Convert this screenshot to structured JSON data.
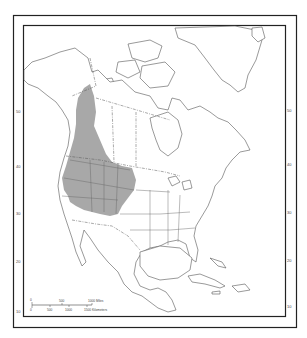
{
  "map": {
    "region": "North America",
    "range_fill_color": "#a8a8a8",
    "frame_color": "#222222",
    "range_description": "Shaded distribution in western North America",
    "latitude_labels_left": [
      "50",
      "40",
      "30",
      "20",
      "10"
    ],
    "latitude_labels_right": [
      "50",
      "40",
      "30",
      "20",
      "10"
    ],
    "scale_bar": {
      "miles_labels": [
        "0",
        "500",
        "1000 Miles"
      ],
      "km_labels": [
        "0",
        "500",
        "1000",
        "1500 Kilometers"
      ]
    }
  }
}
